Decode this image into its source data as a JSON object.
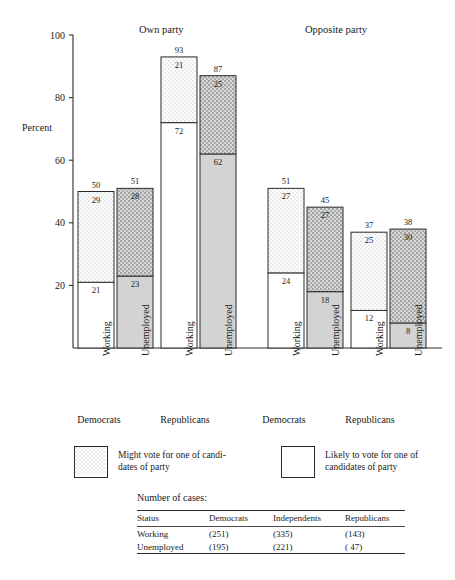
{
  "figure": {
    "y_axis_label": "Percent",
    "group_headers": [
      {
        "label": "Own party"
      },
      {
        "label": "Opposite party"
      }
    ],
    "party_labels": [
      "Democrats",
      "Republicans",
      "Democrats",
      "Republicans"
    ],
    "legend": [
      {
        "swatch": "stipple",
        "text_line1": "Might vote for one of candi-",
        "text_line2": "dates of party"
      },
      {
        "swatch": "white",
        "text_line1": "Likely to vote for one of",
        "text_line2": "candidates of party"
      }
    ],
    "cases_caption": "Number of cases:",
    "cases_table": {
      "headers": [
        "Status",
        "Democrats",
        "Independents",
        "Republicans"
      ],
      "rows": [
        [
          "Working",
          "(251)",
          "(335)",
          "(143)"
        ],
        [
          "Unemployed",
          "(195)",
          "(221)",
          "( 47)"
        ]
      ]
    }
  },
  "chart_data": {
    "type": "bar",
    "title": "",
    "xlabel": "",
    "ylabel": "Percent",
    "ylim": [
      0,
      100
    ],
    "yticks": [
      20,
      40,
      60,
      80,
      100
    ],
    "ytick_labels": [
      "20",
      "40",
      "60",
      "80",
      "100"
    ],
    "grid": false,
    "stacked": true,
    "legend_position": "below-axis",
    "series": [
      {
        "name": "Likely to vote for one of candidates of party",
        "values": [
          21,
          23,
          72,
          62,
          24,
          18,
          12,
          8
        ]
      },
      {
        "name": "Might vote for one of candidates of party",
        "values": [
          29,
          28,
          21,
          25,
          27,
          27,
          25,
          30
        ]
      }
    ],
    "totals": [
      50,
      51,
      93,
      87,
      51,
      45,
      37,
      38
    ],
    "categories": [
      "Working",
      "Unemployed",
      "Working",
      "Unemployed",
      "Working",
      "Unemployed",
      "Working",
      "Unemployed"
    ],
    "groups": [
      {
        "header": "Own party",
        "party": "Democrats",
        "bars": [
          0,
          1
        ]
      },
      {
        "header": "Own party",
        "party": "Republicans",
        "bars": [
          2,
          3
        ]
      },
      {
        "header": "Opposite party",
        "party": "Democrats",
        "bars": [
          4,
          5
        ]
      },
      {
        "header": "Opposite party",
        "party": "Republicans",
        "bars": [
          6,
          7
        ]
      }
    ],
    "bars": [
      {
        "category": "Working",
        "party": "Democrats",
        "side": "Own party",
        "lower": 21,
        "upper": 29,
        "total": 50,
        "style": "light"
      },
      {
        "category": "Unemployed",
        "party": "Democrats",
        "side": "Own party",
        "lower": 23,
        "upper": 28,
        "total": 51,
        "style": "dark"
      },
      {
        "category": "Working",
        "party": "Republicans",
        "side": "Own party",
        "lower": 72,
        "upper": 21,
        "total": 93,
        "style": "light"
      },
      {
        "category": "Unemployed",
        "party": "Republicans",
        "side": "Own party",
        "lower": 62,
        "upper": 25,
        "total": 87,
        "style": "dark"
      },
      {
        "category": "Working",
        "party": "Democrats",
        "side": "Opposite party",
        "lower": 24,
        "upper": 27,
        "total": 51,
        "style": "light"
      },
      {
        "category": "Unemployed",
        "party": "Democrats",
        "side": "Opposite party",
        "lower": 18,
        "upper": 27,
        "total": 45,
        "style": "dark"
      },
      {
        "category": "Working",
        "party": "Republicans",
        "side": "Opposite party",
        "lower": 12,
        "upper": 25,
        "total": 37,
        "style": "light"
      },
      {
        "category": "Unemployed",
        "party": "Republicans",
        "side": "Opposite party",
        "lower": 8,
        "upper": 30,
        "total": 38,
        "style": "dark"
      }
    ]
  }
}
